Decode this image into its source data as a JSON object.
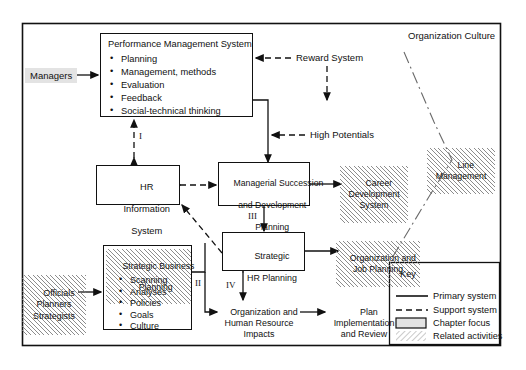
{
  "diagram": {
    "outer_label": "Organization Culture",
    "boxes": {
      "pms": {
        "title": "Performance Management System",
        "items": [
          "Planning",
          "Management, methods",
          "Evaluation",
          "Feedback",
          "Social-technical thinking"
        ]
      },
      "hris": {
        "line1": "HR",
        "line2": "Information",
        "line3": "System"
      },
      "msdp": {
        "line1": "Managerial Succession",
        "line2": "and Development",
        "line3": "Planning"
      },
      "shrp": {
        "line1": "Strategic",
        "line2": "HR Planning"
      },
      "sbp": {
        "line1": "Strategic Business",
        "line2": "Planning",
        "items": [
          "Scanning",
          "Analyses",
          "Policies",
          "Goals",
          "Culture"
        ]
      }
    },
    "actors": {
      "managers": "Managers",
      "officials": "Officials\nPlanners\nStrategists"
    },
    "inputs": {
      "reward_system": "Reward System",
      "high_potentials": "High Potentials"
    },
    "related": {
      "line_management": "Line\nManagement",
      "career_dev": "Career\nDevelopment\nSystem",
      "org_job": "Organization and\nJob Planning"
    },
    "outputs": {
      "org_hr_impacts": "Organization and\nHuman Resource\nImpacts",
      "plan_impl": "Plan\nImplementation\nand Review"
    },
    "numerals": {
      "i": "I",
      "ii": "II",
      "iii": "III",
      "iv": "IV"
    },
    "key": {
      "title": "Key",
      "entries": [
        {
          "label": "Primary system",
          "glyph": "solid-line"
        },
        {
          "label": "Support system",
          "glyph": "dashed-line"
        },
        {
          "label": "Chapter focus",
          "glyph": "shaded-box"
        },
        {
          "label": "Related activities",
          "glyph": "hatched-swatch"
        }
      ]
    },
    "colors": {
      "stroke": "#111111",
      "actor_fill": "#e3e3e3",
      "chapter_focus_fill": "#e3e3e3",
      "background": "#ffffff"
    }
  }
}
